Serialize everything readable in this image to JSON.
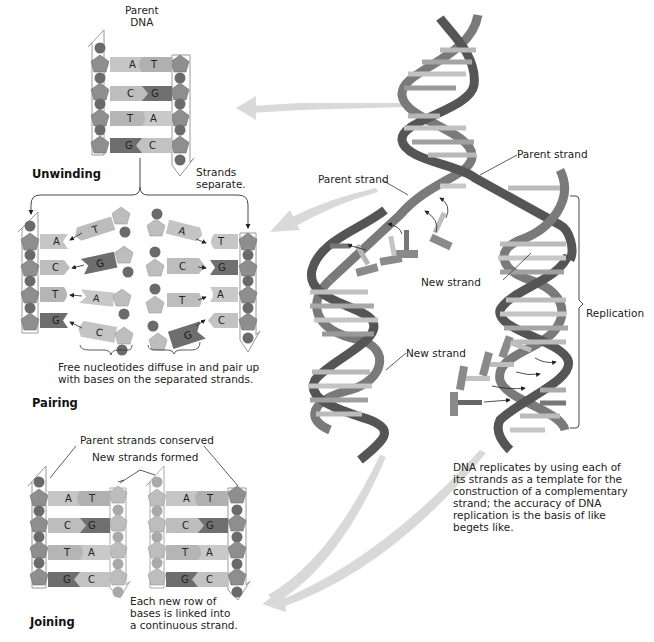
{
  "figure": {
    "title": "DNA Replication",
    "stages": {
      "unwinding": {
        "heading": "Unwinding",
        "label_parent": "Parent DNA",
        "label_parent_line1": "Parent",
        "label_parent_line2": "DNA",
        "note_line1": "Strands",
        "note_line2": "separate.",
        "pairs": [
          [
            "A",
            "T"
          ],
          [
            "C",
            "G"
          ],
          [
            "T",
            "A"
          ],
          [
            "G",
            "C"
          ]
        ]
      },
      "pairing": {
        "heading": "Pairing",
        "left_strand_bases": [
          "A",
          "C",
          "T",
          "G"
        ],
        "right_strand_bases": [
          "T",
          "G",
          "A",
          "C"
        ],
        "free_left": [
          "T",
          "G",
          "A",
          "C"
        ],
        "free_right": [
          "A",
          "C",
          "T",
          "G"
        ],
        "caption_line1": "Free nucleotides diffuse in and pair up",
        "caption_line2": "with bases on the separated strands."
      },
      "joining": {
        "heading": "Joining",
        "label_conserved": "Parent strands conserved",
        "label_new": "New strands formed",
        "pairs": [
          [
            "A",
            "T"
          ],
          [
            "C",
            "G"
          ],
          [
            "T",
            "A"
          ],
          [
            "G",
            "C"
          ]
        ],
        "note_line1": "Each new row of",
        "note_line2": "bases is linked into",
        "note_line3": "a continuous strand."
      }
    },
    "helix_labels": {
      "parent_strand_right": "Parent strand",
      "parent_strand_left": "Parent strand",
      "new_strand_right": "New strand",
      "new_strand_left": "New strand",
      "replication": "Replication"
    },
    "summary": {
      "lines": [
        "DNA replicates by using each of",
        "its strands as a template for the",
        "construction of a complementary",
        "strand; the accuracy of DNA",
        "replication is the basis of like",
        "begets like."
      ]
    },
    "colors": {
      "backbone_pentagon": "#8e8e8e",
      "backbone_circle": "#6a6a6a",
      "base_light": "#c4c4c4",
      "base_mid": "#a8a8a8",
      "base_dark": "#6e6e6e",
      "helix_ribbon": "#7a7a7a",
      "helix_dark": "#4a4a4a",
      "flow_arrow": "#d6d6d6"
    }
  }
}
